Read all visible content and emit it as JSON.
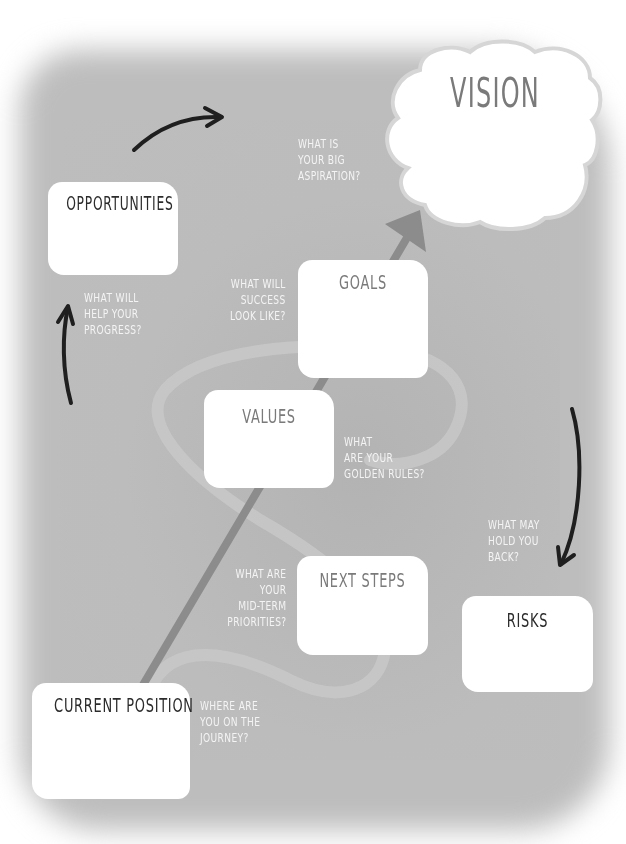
{
  "diagram": {
    "vision": {
      "title": "VISION",
      "question": [
        "WHAT IS",
        "YOUR BIG",
        "ASPIRATION?"
      ]
    },
    "opportunities": {
      "title": "OPPORTUNITIES",
      "question": [
        "WHAT WILL",
        "HELP YOUR",
        "PROGRESS?"
      ]
    },
    "goals": {
      "title": "GOALS",
      "question": [
        "WHAT WILL",
        "SUCCESS",
        "LOOK LIKE?"
      ]
    },
    "values": {
      "title": "VALUES",
      "question": [
        "WHAT",
        "ARE YOUR",
        "GOLDEN RULES?"
      ]
    },
    "next_steps": {
      "title": "NEXT STEPS",
      "question": [
        "WHAT ARE",
        "YOUR",
        "MID-TERM",
        "PRIORITIES?"
      ]
    },
    "risks": {
      "title": "RISKS",
      "question": [
        "WHAT MAY",
        "HOLD YOU",
        "BACK?"
      ]
    },
    "current_position": {
      "title": "CURRENT POSITION",
      "question": [
        "WHERE ARE",
        "YOU ON THE",
        "JOURNEY?"
      ]
    }
  },
  "colors": {
    "background": "#bdbdbd",
    "box": "#ffffff",
    "dark_title": "#2b2b2b",
    "grey_title": "#7a7a7a",
    "question_text": "#f4f4f4",
    "main_arrow": "#8c8c8c",
    "cycle_arrows": "#1f1f1f",
    "swirl": "#c9c9c9"
  },
  "icons": {
    "main_arrow": "diagonal-arrow-up-right",
    "cycle_arrow_top": "curved-arrow-right",
    "cycle_arrow_left": "curved-arrow-up",
    "cycle_arrow_right": "curved-arrow-down"
  }
}
